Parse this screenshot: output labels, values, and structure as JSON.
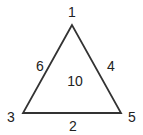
{
  "diagram": {
    "type": "labeled-triangle",
    "stroke_color": "#333333",
    "vertices": [
      {
        "label": "1",
        "position": "top"
      },
      {
        "label": "3",
        "position": "bottom-left"
      },
      {
        "label": "5",
        "position": "bottom-right"
      }
    ],
    "edges": [
      {
        "label": "6",
        "between": [
          "1",
          "3"
        ]
      },
      {
        "label": "4",
        "between": [
          "1",
          "5"
        ]
      },
      {
        "label": "2",
        "between": [
          "3",
          "5"
        ]
      }
    ],
    "face": {
      "label": "10"
    }
  }
}
